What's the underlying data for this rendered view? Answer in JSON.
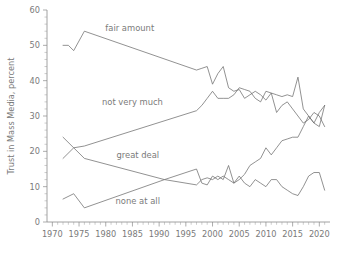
{
  "chart_data": {
    "type": "line",
    "title": "",
    "xlabel": "",
    "ylabel": "Trust in Mass Media, percent",
    "xlim": [
      1969,
      2022
    ],
    "ylim": [
      0,
      60
    ],
    "grid": false,
    "legend": "inline-labels",
    "y_ticks": [
      0,
      10,
      20,
      30,
      40,
      50,
      60
    ],
    "y_tick_labels": [
      "0",
      "10",
      "20",
      "30",
      "40",
      "50",
      "60"
    ],
    "y_minor_step": 2,
    "x_ticks": [
      1970,
      1975,
      1980,
      1985,
      1990,
      1995,
      2000,
      2005,
      2010,
      2015,
      2020
    ],
    "x_tick_labels": [
      "1970",
      "1975",
      "1980",
      "1985",
      "1990",
      "1995",
      "2000",
      "2005",
      "2010",
      "2015",
      "2020"
    ],
    "x_minor_step": 1,
    "series": [
      {
        "name": "fair amount",
        "label": "fair amount",
        "label_x": 1984.5,
        "label_y": 54.0,
        "x": [
          1972,
          1973,
          1974,
          1976,
          1997,
          1998,
          1999,
          2000,
          2001,
          2002,
          2003,
          2004,
          2005,
          2006,
          2007,
          2008,
          2009,
          2010,
          2011,
          2012,
          2013,
          2014,
          2015,
          2016,
          2017,
          2018,
          2019,
          2020,
          2021
        ],
        "values": [
          50,
          50,
          48.5,
          54,
          43,
          43.5,
          44,
          39,
          42,
          44,
          38,
          37,
          37.5,
          35,
          36,
          37,
          36,
          34.5,
          36.5,
          36,
          35.5,
          36,
          35.5,
          41,
          32,
          30,
          28,
          27,
          33
        ]
      },
      {
        "name": "not very much",
        "label": "not very much",
        "label_x": 1985.0,
        "label_y": 33.0,
        "x": [
          1972,
          1974,
          1976,
          1997,
          1998,
          1999,
          2000,
          2001,
          2002,
          2003,
          2004,
          2005,
          2006,
          2007,
          2008,
          2009,
          2010,
          2011,
          2012,
          2013,
          2014,
          2015,
          2016,
          2017,
          2018,
          2019,
          2020,
          2021
        ],
        "values": [
          18,
          21,
          21.5,
          31.5,
          33,
          35,
          37,
          35,
          35,
          35,
          36,
          38,
          37.5,
          37,
          35,
          34,
          37,
          36.5,
          31,
          33,
          34,
          32,
          30,
          28,
          29,
          31,
          30,
          27
        ]
      },
      {
        "name": "great deal",
        "label": "great deal",
        "label_x": 1986.0,
        "label_y": 18.2,
        "x": [
          1972,
          1974,
          1976,
          1991,
          1997,
          1998,
          1999,
          2000,
          2001,
          2002,
          2003,
          2004,
          2005,
          2006,
          2007,
          2008,
          2009,
          2010,
          2011,
          2012,
          2013,
          2014,
          2015,
          2016,
          2017,
          2018,
          2019,
          2020,
          2021
        ],
        "values": [
          24,
          21,
          18,
          12,
          15,
          11,
          10.5,
          13,
          12,
          13,
          12,
          11,
          13,
          11,
          10,
          12,
          11,
          10,
          12,
          12,
          10,
          9,
          8,
          7.5,
          10,
          13,
          14,
          14,
          9
        ]
      },
      {
        "name": "none at all",
        "label": "none at all",
        "label_x": 1986.0,
        "label_y": 5.0,
        "x": [
          1972,
          1974,
          1976,
          1991,
          1997,
          1998,
          1999,
          2000,
          2001,
          2002,
          2003,
          2004,
          2005,
          2006,
          2007,
          2008,
          2009,
          2010,
          2011,
          2012,
          2013,
          2014,
          2015,
          2016,
          2017,
          2018,
          2019,
          2020,
          2021
        ],
        "values": [
          6.5,
          8,
          4,
          12,
          10.5,
          12,
          12.5,
          12,
          13,
          12,
          16,
          11,
          12,
          13.5,
          16,
          17,
          18,
          21,
          19,
          21,
          23,
          23.5,
          24,
          24,
          27,
          30,
          28,
          31,
          33
        ]
      }
    ]
  },
  "caption": ""
}
